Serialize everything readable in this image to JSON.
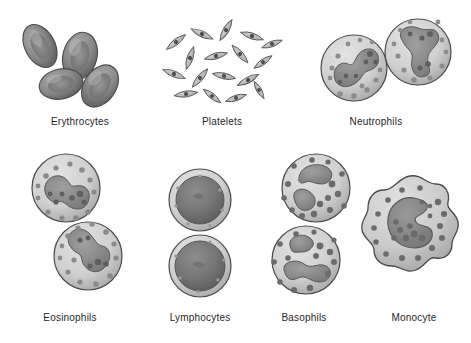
{
  "figure": {
    "background_color": "#ffffff",
    "style": "grayscale medical illustration",
    "label_color": "#1f1f1f",
    "label_font_size_px": 10
  },
  "palette": {
    "erythrocyte_fill": "#8f8f8f",
    "erythrocyte_rim": "#5c5c5c",
    "erythrocyte_center": "#6a6a6a",
    "platelet_fill": "#b6b6b6",
    "platelet_nucleus": "#4f4f4f",
    "cytoplasm_light": "#d6d6d6",
    "cytoplasm_mid": "#c2c2c2",
    "nucleus_mid": "#8d8d8d",
    "nucleus_dark": "#6d6d6d",
    "granule_dark": "#5f5f5f",
    "granule_mid": "#8a8a8a",
    "outline": "#4a4a4a",
    "lymphocyte_nucleus": "#6f6f6f"
  },
  "groups": [
    {
      "id": "erythrocytes",
      "label": "Erythrocytes",
      "cell_count": 4,
      "shape": "biconcave-disc",
      "description": "Cluster of four overlapping biconcave discs with pale central dimples",
      "row": 1,
      "column": 1,
      "label_x": 32,
      "label_y": 116,
      "label_width": 96
    },
    {
      "id": "platelets",
      "label": "Platelets",
      "cell_count": 17,
      "shape": "spindle-fragment",
      "description": "Scatter of small pointed lens-shaped fragments each with a dark central granule",
      "row": 1,
      "column": 2,
      "label_x": 180,
      "label_y": 116,
      "label_width": 84
    },
    {
      "id": "neutrophils",
      "label": "Neutrophils",
      "cell_count": 2,
      "shape": "round-granulocyte",
      "description": "Two round cells with multilobed S-shaped nuclei and fine granules",
      "row": 1,
      "column": 3,
      "label_x": 328,
      "label_y": 116,
      "label_width": 96
    },
    {
      "id": "eosinophils",
      "label": "Eosinophils",
      "cell_count": 2,
      "shape": "round-granulocyte",
      "description": "Two round cells with bilobed nuclei and coarse granules",
      "row": 2,
      "column": 1,
      "label_x": 22,
      "label_y": 312,
      "label_width": 96
    },
    {
      "id": "lymphocytes",
      "label": "Lymphocytes",
      "cell_count": 2,
      "shape": "round-agranulocyte",
      "description": "Two round cells with large dark round nuclei and a thin rim of cytoplasm",
      "row": 2,
      "column": 2,
      "label_x": 148,
      "label_y": 312,
      "label_width": 104
    },
    {
      "id": "basophils",
      "label": "Basophils",
      "cell_count": 2,
      "shape": "round-granulocyte",
      "description": "Two round cells with lobed nuclei and large coarse granules",
      "row": 2,
      "column": 3,
      "label_x": 258,
      "label_y": 312,
      "label_width": 92
    },
    {
      "id": "monocyte",
      "label": "Monocyte",
      "cell_count": 1,
      "shape": "irregular-amoeboid",
      "description": "Single large cell with a ruffled membrane and a kidney-shaped nucleus",
      "row": 2,
      "column": 4,
      "label_x": 368,
      "label_y": 312,
      "label_width": 92
    }
  ]
}
